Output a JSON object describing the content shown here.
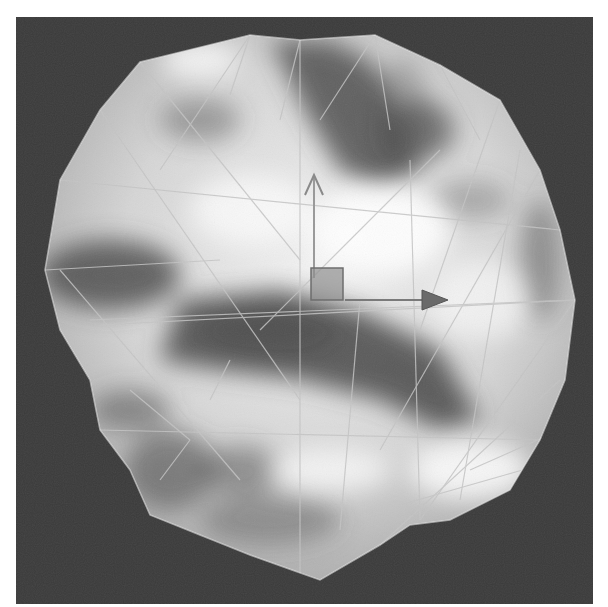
{
  "viewport": {
    "name": "3D perspective viewport",
    "background_color": "#3a3a3a",
    "object": {
      "type": "textured low-poly sphere",
      "texture": "cloud / noise map",
      "display": "smooth shaded with wireframe overlay",
      "base_color": "#d8d8d8",
      "dark_patch_color": "#4a4a4a",
      "wire_color": "#bdbdbd"
    },
    "gizmo": {
      "type": "move",
      "center_box_color": "#8a8a8a",
      "x_axis": {
        "direction": "right",
        "head": "filled-cone",
        "color": "#6a6a6a"
      },
      "y_axis": {
        "direction": "up",
        "head": "open-arrow",
        "color": "#9a9a9a"
      }
    }
  }
}
